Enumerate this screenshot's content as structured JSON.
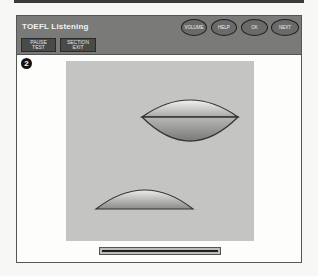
{
  "header": {
    "title": "TOEFL Listening",
    "buttons_left": [
      {
        "line1": "PAUSE",
        "line2": "TEST"
      },
      {
        "line1": "SECTION",
        "line2": "EXIT"
      }
    ],
    "buttons_right": [
      {
        "label": "VOLUME"
      },
      {
        "label": "HELP"
      },
      {
        "label": "OK"
      },
      {
        "label": "NEXT"
      }
    ]
  },
  "question": {
    "number": "2"
  },
  "image": {
    "description": "Diagram of a lens shape split horizontally and a dome-shaped half lens",
    "shapes": [
      "lens-split",
      "half-dome"
    ]
  },
  "progress": {
    "percent": 100
  },
  "colors": {
    "header_bg": "#7a7a78",
    "panel_bg": "#c4c4c2",
    "button_dark": "#4a4a48"
  }
}
